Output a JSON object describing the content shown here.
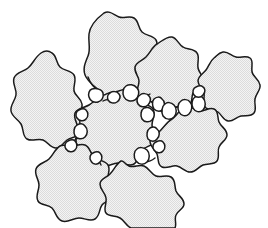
{
  "figure": {
    "width": 268,
    "height": 228,
    "background_color": "#ffffff",
    "line_color": "#1a1a1a",
    "grain_fill_color": "#ececec",
    "stipple_dot_color": "#d8d8d8",
    "small_grain_fill_color": "#ffffff",
    "line_width": 1.5,
    "style": "ink line art with halftone stipple fill",
    "large_grain_count": 8,
    "small_grain_count": 17
  },
  "large_grains": [
    {
      "id": "grain-top",
      "label": "top rounded aggregate",
      "centroid": [
        113,
        48
      ],
      "path": "M 104 13 C 96 19 90 26 89 34 C 88 42 91 49 88 56 C 85 63 82 70 86 77 C 90 84 96 88 102 92 C 104 95 100 99 103 101 C 107 103 111 99 115 100 C 120 101 121 106 126 106 C 131 106 133 101 137 99 C 142 97 147 98 150 94 C 153 90 150 85 152 81 C 155 76 161 75 162 70 C 163 64 157 61 156 56 C 155 50 159 45 156 40 C 153 35 146 36 142 32 C 138 28 139 21 134 18 C 129 15 124 19 119 17 C 114 15 110 10 104 13 Z"
    },
    {
      "id": "grain-left",
      "label": "left rounded aggregate",
      "centroid": [
        52,
        94
      ],
      "path": "M 41 53 C 35 57 33 64 28 68 C 23 72 16 72 14 78 C 12 84 17 89 16 95 C 15 101 10 105 11 111 C 12 117 18 119 21 124 C 24 129 22 136 27 139 C 32 142 38 138 43 140 C 48 142 50 148 56 148 C 61 148 63 143 67 140 C 71 137 77 138 79 133 C 81 128 76 124 77 119 C 78 113 83 110 82 104 C 81 98 75 96 74 91 C 73 85 77 80 74 75 C 71 70 64 71 60 67 C 56 63 57 56 52 53 C 48 50 44 51 41 53 Z"
    },
    {
      "id": "grain-upper-right",
      "label": "upper right rounded aggregate",
      "centroid": [
        175,
        72
      ],
      "path": "M 157 44 C 152 47 150 53 146 57 C 142 61 136 62 135 67 C 134 73 139 76 139 81 C 139 87 135 91 138 96 C 141 101 147 99 152 102 C 157 105 158 111 163 112 C 168 113 171 108 176 107 C 181 106 185 109 189 106 C 193 103 191 97 193 93 C 196 88 202 87 203 82 C 204 76 199 73 198 68 C 197 62 200 57 197 53 C 194 48 187 50 183 47 C 178 44 177 38 172 37 C 167 36 162 41 157 44 Z"
    },
    {
      "id": "grain-far-right",
      "label": "far right small rounded aggregate",
      "centroid": [
        228,
        85
      ],
      "path": "M 214 58 C 210 61 209 66 206 70 C 203 74 198 76 198 81 C 198 86 203 88 204 93 C 205 98 202 103 205 107 C 208 111 214 109 218 112 C 222 115 223 120 228 121 C 233 122 236 117 241 116 C 246 115 251 117 254 113 C 257 109 254 104 255 99 C 256 93 261 90 260 85 C 259 79 253 77 252 72 C 251 66 254 61 250 58 C 246 55 241 58 236 57 C 231 56 228 51 223 52 C 218 53 217 56 214 58 Z"
    },
    {
      "id": "grain-center",
      "label": "central rounded aggregate",
      "centroid": [
        113,
        128
      ],
      "path": "M 104 95 C 98 97 94 102 89 105 C 84 108 77 108 75 113 C 73 119 78 123 78 129 C 78 135 74 140 77 145 C 80 150 87 149 91 153 C 95 157 95 164 101 166 C 107 168 112 163 118 163 C 124 163 129 167 134 164 C 139 161 138 154 142 150 C 146 146 153 146 155 141 C 157 135 152 131 152 125 C 152 119 156 114 153 109 C 150 104 143 105 139 101 C 135 97 135 91 130 89 C 125 87 120 92 114 92 C 109 92 107 94 104 95 Z"
    },
    {
      "id": "grain-right-lower",
      "label": "right lower rounded aggregate",
      "centroid": [
        196,
        143
      ],
      "path": "M 172 119 C 167 122 164 127 160 131 C 156 135 150 136 150 141 C 150 147 155 149 157 154 C 159 159 157 165 162 167 C 167 169 172 165 177 166 C 182 167 185 172 190 172 C 196 172 198 167 203 165 C 208 163 214 165 217 161 C 220 157 217 151 219 147 C 221 142 227 140 227 135 C 227 129 221 127 219 122 C 217 117 219 111 214 109 C 209 107 204 112 199 111 C 194 110 191 105 186 106 C 181 107 177 116 172 119 Z"
    },
    {
      "id": "grain-bottom-left",
      "label": "bottom left rounded aggregate",
      "centroid": [
        73,
        180
      ],
      "path": "M 60 146 C 55 149 53 155 49 159 C 45 163 38 163 36 169 C 34 175 39 179 39 185 C 39 191 35 196 38 201 C 41 206 48 204 52 208 C 56 212 56 219 62 221 C 68 223 73 218 79 218 C 85 218 90 222 95 219 C 100 216 99 209 102 205 C 105 201 112 200 113 195 C 114 189 109 186 108 180 C 107 174 111 170 108 165 C 105 160 98 161 94 157 C 90 153 90 147 85 145 C 80 143 75 147 69 146 C 64 145 62 145 60 146 Z"
    },
    {
      "id": "grain-bottom-right",
      "label": "bottom right rounded aggregate",
      "centroid": [
        144,
        186
      ],
      "path": "M 121 161 C 116 164 114 170 110 174 C 106 178 100 179 100 184 C 100 190 105 192 106 198 C 107 204 103 209 106 213 C 109 217 115 215 120 218 C 125 221 126 226 131 228 L 175 228 C 177 224 174 219 176 215 C 178 210 184 209 184 204 C 184 198 178 196 176 191 C 174 185 176 180 171 177 C 166 174 161 178 156 176 C 151 174 149 168 144 166 C 139 164 134 168 129 166 C 124 164 124 160 121 161 Z"
    }
  ],
  "small_grains": [
    {
      "id": "pebble-01",
      "centroid": [
        96,
        95
      ],
      "path": "M 92 89 C 89 90 88 94 89 97 C 90 101 94 103 98 102 C 102 101 104 97 103 93 C 102 89 96 88 92 89 Z"
    },
    {
      "id": "pebble-02",
      "centroid": [
        114,
        97
      ],
      "path": "M 110 93 C 108 94 107 97 108 100 C 110 103 114 104 117 102 C 120 100 121 96 119 94 C 117 91 112 91 110 93 Z"
    },
    {
      "id": "pebble-03",
      "centroid": [
        131,
        92
      ],
      "path": "M 126 86 C 123 88 122 93 124 97 C 126 101 131 102 135 100 C 139 97 140 91 137 88 C 134 84 129 84 126 86 Z"
    },
    {
      "id": "pebble-04",
      "centroid": [
        144,
        100
      ],
      "path": "M 140 95 C 137 97 136 101 138 104 C 140 107 145 108 148 105 C 151 102 151 98 149 96 C 147 93 142 93 140 95 Z"
    },
    {
      "id": "pebble-05",
      "centroid": [
        148,
        114
      ],
      "path": "M 144 108 C 141 110 140 115 142 119 C 144 122 149 123 152 120 C 155 117 155 112 152 110 C 150 107 146 107 144 108 Z"
    },
    {
      "id": "pebble-06",
      "centroid": [
        158,
        104
      ],
      "path": "M 154 99 C 152 101 152 106 154 109 C 157 112 161 112 163 109 C 165 106 165 101 162 99 C 160 96 156 97 154 99 Z"
    },
    {
      "id": "pebble-07",
      "centroid": [
        170,
        110
      ],
      "path": "M 165 104 C 162 106 161 112 163 116 C 166 120 171 120 174 117 C 177 114 177 108 174 105 C 171 102 167 102 165 104 Z"
    },
    {
      "id": "pebble-08",
      "centroid": [
        186,
        107
      ],
      "path": "M 181 101 C 178 103 177 108 179 112 C 181 116 186 117 189 114 C 192 111 193 105 190 102 C 188 99 183 99 181 101 Z"
    },
    {
      "id": "pebble-09",
      "centroid": [
        199,
        103
      ],
      "path": "M 195 97 C 192 99 191 104 193 108 C 195 112 200 113 203 110 C 206 107 206 101 203 98 C 201 95 197 95 195 97 Z"
    },
    {
      "id": "pebble-10",
      "centroid": [
        200,
        92
      ],
      "path": "M 196 87 C 193 88 192 92 194 95 C 196 98 201 98 203 95 C 206 92 205 88 203 87 C 201 85 198 86 196 87 Z"
    },
    {
      "id": "pebble-11",
      "centroid": [
        83,
        115
      ],
      "path": "M 79 110 C 76 111 75 115 77 118 C 79 121 84 122 86 119 C 89 116 88 112 86 110 C 84 108 81 109 79 110 Z"
    },
    {
      "id": "pebble-12",
      "centroid": [
        81,
        131
      ],
      "path": "M 77 125 C 74 127 73 132 75 136 C 77 139 82 140 85 137 C 88 134 88 129 85 126 C 83 123 79 124 77 125 Z"
    },
    {
      "id": "pebble-13",
      "centroid": [
        72,
        146
      ],
      "path": "M 68 141 C 65 142 64 146 66 149 C 68 152 73 153 75 150 C 78 147 77 143 75 141 C 73 139 70 140 68 141 Z"
    },
    {
      "id": "pebble-14",
      "centroid": [
        97,
        158
      ],
      "path": "M 93 153 C 90 154 89 158 91 161 C 93 165 98 165 100 162 C 103 159 102 155 100 153 C 98 151 95 152 93 153 Z"
    },
    {
      "id": "pebble-15",
      "centroid": [
        142,
        155
      ],
      "path": "M 137 149 C 134 151 133 157 136 161 C 139 165 144 165 147 162 C 150 159 150 153 147 150 C 144 147 139 147 137 149 Z"
    },
    {
      "id": "pebble-16",
      "centroid": [
        154,
        134
      ],
      "path": "M 150 128 C 147 130 146 135 148 139 C 151 142 155 142 157 139 C 160 136 160 131 157 129 C 155 126 152 127 150 128 Z"
    },
    {
      "id": "pebble-17",
      "centroid": [
        160,
        147
      ],
      "path": "M 156 142 C 153 143 152 147 154 150 C 156 153 161 154 163 151 C 166 148 165 144 163 142 C 161 140 158 141 156 142 Z"
    }
  ],
  "contact_bridges": [
    {
      "id": "bridge-top-left",
      "path": "M 88 77 C 90 83 94 88 100 92"
    },
    {
      "id": "bridge-top-center",
      "path": "M 103 101 C 106 99 110 99 114 100"
    },
    {
      "id": "bridge-top-right",
      "path": "M 137 99 C 141 96 145 97 150 94"
    },
    {
      "id": "bridge-mid-right",
      "path": "M 152 102 C 156 104 161 106 165 107"
    },
    {
      "id": "bridge-right-chain",
      "path": "M 174 108 C 179 106 184 105 190 105"
    },
    {
      "id": "bridge-left-chain",
      "path": "M 79 112 C 81 118 79 124 80 130"
    },
    {
      "id": "bridge-lower-left",
      "path": "M 76 138 C 74 142 72 145 71 148"
    },
    {
      "id": "bridge-bottom",
      "path": "M 101 165 C 99 161 98 159 97 157"
    },
    {
      "id": "bridge-bottom-right",
      "path": "M 141 161 C 146 163 150 162 155 158"
    }
  ]
}
